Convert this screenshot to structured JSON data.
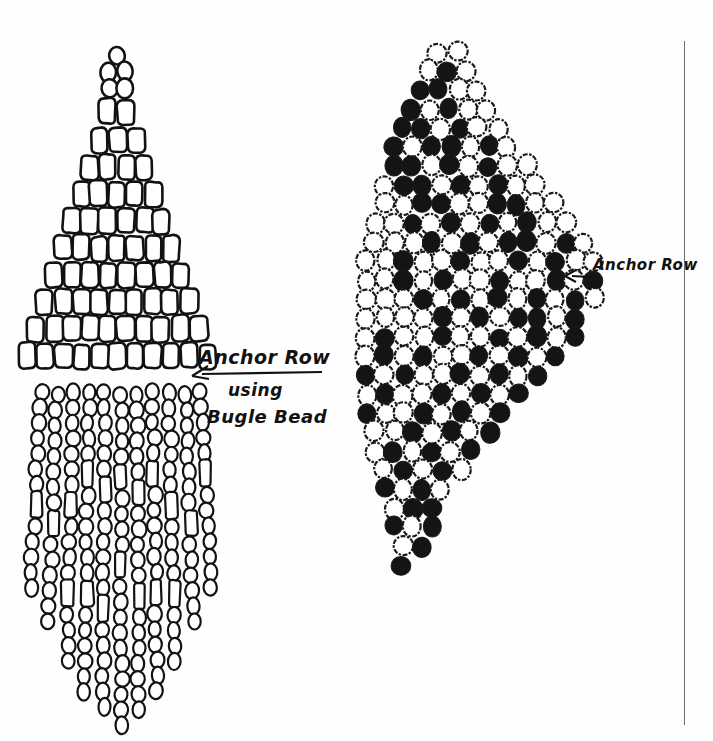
{
  "page": {
    "background_color": "#fefefe",
    "ink_color": "#14110f",
    "margin_rule_color": "#6e6e6e"
  },
  "annotations": [
    {
      "id": "anchor-row-left",
      "text": "Anchor Row",
      "x": 199,
      "y": 346
    },
    {
      "id": "using",
      "text": "using",
      "x": 228,
      "y": 380
    },
    {
      "id": "bugle-bead",
      "text": "Bugle Bead",
      "x": 207,
      "y": 406
    },
    {
      "id": "anchor-row-right",
      "text": "Anchor Row",
      "x": 593,
      "y": 256
    }
  ],
  "left_diagram": {
    "name": "bugle-bead-triangle-fringe",
    "bead_outline_color": "#14110f",
    "bead_fill_color": "#ffffff",
    "anchor_row_index": 11,
    "triangle": {
      "apex_x": 117,
      "top_y": 52,
      "row_height": 27,
      "bead_width": 17,
      "bead_height": 25,
      "rows": [
        {
          "type": "oval",
          "count": 1,
          "y": 56,
          "pitch": 15
        },
        {
          "type": "oval",
          "count": 2,
          "y": 72,
          "pitch": 16
        },
        {
          "type": "oval",
          "count": 2,
          "y": 89,
          "pitch": 16
        },
        {
          "type": "bugle",
          "count": 2,
          "y": 112,
          "pitch": 18
        },
        {
          "type": "bugle",
          "count": 3,
          "y": 140,
          "pitch": 18
        },
        {
          "type": "bugle",
          "count": 4,
          "y": 167,
          "pitch": 18
        },
        {
          "type": "bugle",
          "count": 5,
          "y": 194,
          "pitch": 18
        },
        {
          "type": "bugle",
          "count": 6,
          "y": 221,
          "pitch": 18
        },
        {
          "type": "bugle",
          "count": 7,
          "y": 248,
          "pitch": 18
        },
        {
          "type": "bugle",
          "count": 8,
          "y": 275,
          "pitch": 18
        },
        {
          "type": "bugle",
          "count": 9,
          "y": 302,
          "pitch": 18
        },
        {
          "type": "bugle",
          "count": 10,
          "y": 329,
          "pitch": 18
        },
        {
          "type": "bugle",
          "count": 11,
          "y": 356,
          "pitch": 18
        }
      ]
    },
    "fringe": {
      "top_y": 385,
      "strand_pitch": 16,
      "strand_count": 11,
      "left_x": 41,
      "strand_lengths": [
        13,
        15,
        17,
        19,
        20,
        21,
        20,
        19,
        17,
        15,
        13
      ],
      "bead_sequences": [
        [
          "r",
          "r",
          "r",
          "r",
          "r",
          "r",
          "r",
          "b",
          "r",
          "r",
          "r",
          "r",
          "r"
        ],
        [
          "r",
          "r",
          "r",
          "r",
          "r",
          "r",
          "r",
          "r",
          "b",
          "r",
          "r",
          "r",
          "r",
          "r",
          "r"
        ],
        [
          "r",
          "r",
          "r",
          "r",
          "r",
          "r",
          "r",
          "b",
          "r",
          "r",
          "r",
          "r",
          "b",
          "r",
          "r",
          "r",
          "r"
        ],
        [
          "r",
          "r",
          "r",
          "r",
          "r",
          "b",
          "r",
          "r",
          "r",
          "r",
          "r",
          "r",
          "b",
          "r",
          "r",
          "r",
          "r",
          "r",
          "r"
        ],
        [
          "r",
          "r",
          "r",
          "r",
          "r",
          "r",
          "b",
          "r",
          "r",
          "r",
          "r",
          "r",
          "r",
          "b",
          "r",
          "r",
          "r",
          "r",
          "r",
          "r"
        ],
        [
          "r",
          "r",
          "r",
          "r",
          "r",
          "b",
          "r",
          "r",
          "r",
          "r",
          "b",
          "r",
          "r",
          "r",
          "r",
          "r",
          "r",
          "r",
          "r",
          "r",
          "r"
        ],
        [
          "r",
          "r",
          "r",
          "r",
          "r",
          "r",
          "b",
          "r",
          "r",
          "r",
          "r",
          "r",
          "b",
          "r",
          "r",
          "r",
          "r",
          "r",
          "r",
          "r"
        ],
        [
          "r",
          "r",
          "r",
          "r",
          "r",
          "b",
          "r",
          "r",
          "r",
          "r",
          "r",
          "r",
          "b",
          "r",
          "r",
          "r",
          "r",
          "r",
          "r"
        ],
        [
          "r",
          "r",
          "r",
          "r",
          "r",
          "r",
          "r",
          "b",
          "r",
          "r",
          "r",
          "r",
          "b",
          "r",
          "r",
          "r",
          "r"
        ],
        [
          "r",
          "r",
          "r",
          "r",
          "r",
          "r",
          "r",
          "r",
          "b",
          "r",
          "r",
          "r",
          "r",
          "r",
          "r"
        ],
        [
          "r",
          "r",
          "r",
          "r",
          "r",
          "b",
          "r",
          "r",
          "r",
          "r",
          "r",
          "r",
          "r"
        ]
      ]
    },
    "arrow": {
      "from_x": 322,
      "to_x": 192,
      "y": 373
    }
  },
  "right_diagram": {
    "name": "round-bead-diamond-brick-stitch",
    "bead_dark_color": "#141414",
    "bead_light_fill": "#ffffff",
    "bead_outline_color": "#1a1a1a",
    "bead_diameter": 20,
    "row_pitch": 19,
    "col_pitch": 19,
    "top_y": 52,
    "anchor_row_index": 11,
    "rows": [
      {
        "start_x": 438,
        "pattern": [
          "w",
          "w"
        ]
      },
      {
        "start_x": 429,
        "pattern": [
          "w",
          "d",
          "w"
        ]
      },
      {
        "start_x": 420,
        "pattern": [
          "d",
          "d",
          "w",
          "w"
        ]
      },
      {
        "start_x": 411,
        "pattern": [
          "d",
          "w",
          "d",
          "w",
          "w"
        ]
      },
      {
        "start_x": 402,
        "pattern": [
          "d",
          "d",
          "w",
          "d",
          "w",
          "w"
        ]
      },
      {
        "start_x": 393,
        "pattern": [
          "d",
          "w",
          "d",
          "d",
          "w",
          "d",
          "w"
        ]
      },
      {
        "start_x": 393,
        "pattern": [
          "d",
          "d",
          "w",
          "d",
          "w",
          "d",
          "w",
          "w"
        ]
      },
      {
        "start_x": 384,
        "pattern": [
          "w",
          "d",
          "d",
          "w",
          "d",
          "w",
          "d",
          "w",
          "w"
        ]
      },
      {
        "start_x": 384,
        "pattern": [
          "w",
          "w",
          "d",
          "d",
          "w",
          "w",
          "d",
          "d",
          "w",
          "w"
        ]
      },
      {
        "start_x": 375,
        "pattern": [
          "w",
          "w",
          "d",
          "w",
          "d",
          "w",
          "d",
          "w",
          "d",
          "w",
          "w"
        ]
      },
      {
        "start_x": 375,
        "pattern": [
          "w",
          "w",
          "w",
          "d",
          "w",
          "d",
          "w",
          "d",
          "d",
          "w",
          "d",
          "w"
        ]
      },
      {
        "start_x": 366,
        "pattern": [
          "w",
          "w",
          "d",
          "w",
          "w",
          "d",
          "w",
          "w",
          "d",
          "w",
          "d",
          "w",
          "w"
        ]
      },
      {
        "start_x": 366,
        "pattern": [
          "w",
          "w",
          "d",
          "w",
          "d",
          "w",
          "w",
          "d",
          "w",
          "w",
          "d",
          "w",
          "d"
        ]
      },
      {
        "start_x": 366,
        "pattern": [
          "w",
          "w",
          "w",
          "d",
          "w",
          "d",
          "w",
          "d",
          "w",
          "d",
          "w",
          "d",
          "w"
        ]
      },
      {
        "start_x": 366,
        "pattern": [
          "w",
          "w",
          "w",
          "w",
          "d",
          "w",
          "d",
          "w",
          "d",
          "d",
          "w",
          "d"
        ]
      },
      {
        "start_x": 366,
        "pattern": [
          "w",
          "d",
          "w",
          "w",
          "d",
          "w",
          "w",
          "d",
          "w",
          "d",
          "w",
          "d"
        ]
      },
      {
        "start_x": 366,
        "pattern": [
          "w",
          "d",
          "w",
          "d",
          "w",
          "w",
          "d",
          "w",
          "d",
          "w",
          "d"
        ]
      },
      {
        "start_x": 366,
        "pattern": [
          "d",
          "w",
          "d",
          "w",
          "w",
          "d",
          "w",
          "d",
          "w",
          "d"
        ]
      },
      {
        "start_x": 366,
        "pattern": [
          "w",
          "d",
          "w",
          "w",
          "d",
          "w",
          "d",
          "w",
          "d"
        ]
      },
      {
        "start_x": 366,
        "pattern": [
          "d",
          "w",
          "w",
          "d",
          "w",
          "d",
          "w",
          "d"
        ]
      },
      {
        "start_x": 375,
        "pattern": [
          "w",
          "w",
          "d",
          "w",
          "d",
          "w",
          "d"
        ]
      },
      {
        "start_x": 375,
        "pattern": [
          "w",
          "d",
          "w",
          "d",
          "w",
          "d"
        ]
      },
      {
        "start_x": 384,
        "pattern": [
          "w",
          "d",
          "w",
          "d",
          "w"
        ]
      },
      {
        "start_x": 384,
        "pattern": [
          "d",
          "w",
          "d",
          "w"
        ]
      },
      {
        "start_x": 393,
        "pattern": [
          "w",
          "d",
          "d"
        ]
      },
      {
        "start_x": 393,
        "pattern": [
          "d",
          "w",
          "d"
        ]
      },
      {
        "start_x": 402,
        "pattern": [
          "w",
          "d"
        ]
      },
      {
        "start_x": 402,
        "pattern": [
          "d"
        ]
      }
    ],
    "arrow": {
      "from_x": 590,
      "to_x": 565,
      "y": 277
    }
  }
}
